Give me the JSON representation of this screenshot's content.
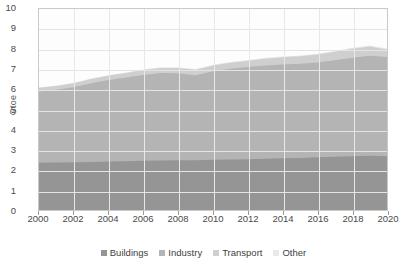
{
  "chart_data": {
    "type": "area",
    "stacked": true,
    "title": "",
    "subtitle": "",
    "xlabel": "",
    "ylabel": "Gtoe",
    "ylim": [
      0,
      10
    ],
    "xlim": [
      2000,
      2020
    ],
    "grid": true,
    "legend_position": "bottom",
    "x": [
      2000,
      2001,
      2002,
      2003,
      2004,
      2005,
      2006,
      2007,
      2008,
      2009,
      2010,
      2011,
      2012,
      2013,
      2014,
      2015,
      2016,
      2017,
      2018,
      2019,
      2020
    ],
    "xticks": [
      "2000",
      "2002",
      "2004",
      "2006",
      "2008",
      "2010",
      "2012",
      "2014",
      "2016",
      "2018",
      "2020"
    ],
    "yticks": [
      "0",
      "1",
      "2",
      "3",
      "4",
      "5",
      "6",
      "7",
      "8",
      "9",
      "10"
    ],
    "series": [
      {
        "name": "Buildings",
        "color": "#959595",
        "values": [
          2.35,
          2.36,
          2.37,
          2.39,
          2.41,
          2.43,
          2.45,
          2.46,
          2.47,
          2.48,
          2.5,
          2.51,
          2.53,
          2.55,
          2.57,
          2.59,
          2.62,
          2.65,
          2.68,
          2.7,
          2.68
        ]
      },
      {
        "name": "Industry",
        "color": "#b4b4b4",
        "values": [
          3.55,
          3.62,
          3.74,
          3.92,
          4.06,
          4.16,
          4.27,
          4.35,
          4.33,
          4.22,
          4.4,
          4.52,
          4.58,
          4.64,
          4.67,
          4.68,
          4.72,
          4.8,
          4.9,
          4.98,
          4.93
        ]
      },
      {
        "name": "Transport",
        "color": "#cfcfcf",
        "values": [
          0.18,
          0.19,
          0.2,
          0.21,
          0.22,
          0.23,
          0.24,
          0.26,
          0.27,
          0.28,
          0.29,
          0.3,
          0.32,
          0.34,
          0.36,
          0.38,
          0.4,
          0.42,
          0.44,
          0.46,
          0.38
        ]
      },
      {
        "name": "Other",
        "color": "#e9e9e9",
        "values": [
          0.02,
          0.02,
          0.02,
          0.02,
          0.02,
          0.02,
          0.03,
          0.03,
          0.03,
          0.03,
          0.03,
          0.03,
          0.03,
          0.04,
          0.04,
          0.04,
          0.04,
          0.04,
          0.05,
          0.05,
          0.04
        ]
      }
    ],
    "totals": [
      6.1,
      6.19,
      6.33,
      6.54,
      6.71,
      6.84,
      6.99,
      7.1,
      7.1,
      7.01,
      7.22,
      7.36,
      7.46,
      7.57,
      7.64,
      7.69,
      7.78,
      7.91,
      8.07,
      8.19,
      8.03
    ]
  },
  "axis": {
    "ylabel": "Gtoe"
  },
  "legend": {
    "items": [
      {
        "label": "Buildings",
        "color": "#959595"
      },
      {
        "label": "Industry",
        "color": "#b4b4b4"
      },
      {
        "label": "Transport",
        "color": "#cfcfcf"
      },
      {
        "label": "Other",
        "color": "#e9e9e9"
      }
    ]
  }
}
